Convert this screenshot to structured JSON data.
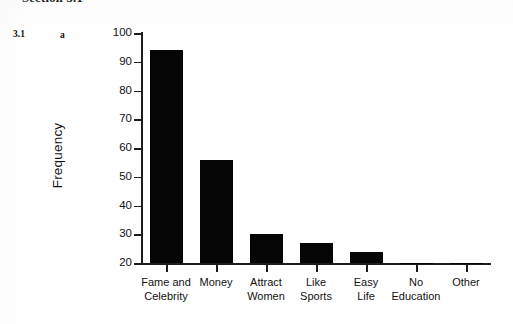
{
  "header": {
    "running_title": "Section 3.1"
  },
  "exercise": {
    "number": "3.1",
    "part": "a"
  },
  "chart_data": {
    "type": "bar",
    "title": "",
    "xlabel": "",
    "ylabel": "Frequency",
    "categories": [
      "Fame and Celebrity",
      "Money",
      "Attract Women",
      "Like Sports",
      "Easy Life",
      "No Education",
      "Other"
    ],
    "category_lines": [
      [
        "Fame and",
        "Celebrity"
      ],
      [
        "Money"
      ],
      [
        "Attract",
        "Women"
      ],
      [
        "Like",
        "Sports"
      ],
      [
        "Easy",
        "Life"
      ],
      [
        "No",
        "Education"
      ],
      [
        "Other"
      ]
    ],
    "values": [
      94,
      56,
      30,
      27,
      24,
      20,
      20
    ],
    "ylim": [
      20,
      100
    ],
    "ytick_labels": [
      "100",
      "90",
      "80",
      "70",
      "60",
      "50",
      "40",
      "30",
      "20"
    ],
    "ytick_values": [
      100,
      90,
      80,
      70,
      60,
      50,
      40,
      30,
      20
    ],
    "grid": false,
    "legend": false,
    "bar_color": "#050505",
    "axis_color": "#1c1c1c"
  }
}
